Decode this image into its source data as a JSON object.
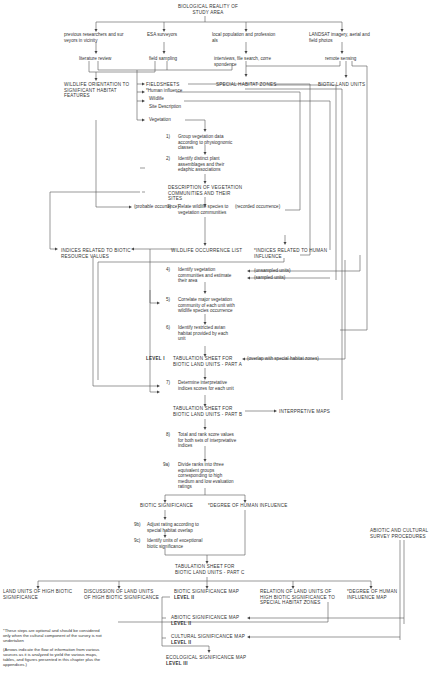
{
  "title": "BIOLOGICAL REALITY OF\nSTUDY AREA",
  "sources": [
    {
      "label": "previous researchers and sur\nveyors in vicinity",
      "method": "literature review"
    },
    {
      "label": "ESA surveyors",
      "method": "field sampling"
    },
    {
      "label": "local population and profession\nals",
      "method": "interviews, file search, corre\nspondence"
    },
    {
      "label": "LANDSAT imagery, aerial and\nfield photos",
      "method": "remote sensing"
    }
  ],
  "wildlife_orientation": "WILDLIFE ORIENTATION TO\nSIGNIFICANT HABITAT\nFEATURES",
  "fieldsheets": {
    "title": "FIELDSHEETS",
    "items": [
      "*Human influence",
      "Wildlife",
      "Site Description",
      "Vegetation"
    ]
  },
  "special_habitat_zones": "SPECIAL HABITAT ZONES",
  "biotic_land_units": "BIOTIC LAND UNITS",
  "steps": {
    "s1": {
      "num": "1)",
      "text": "Group vegetation data\naccording to physiognomic\nclasses"
    },
    "s2": {
      "num": "2)",
      "text": "Identify distinct plant\nassemblages and their\nedaphic associations"
    },
    "s3": {
      "num": "3)",
      "text": "Relate wildlife species to\nvegetation communities"
    },
    "s4": {
      "num": "4)",
      "text": "Identify vegetation\ncommunities and estimate\ntheir area"
    },
    "s5": {
      "num": "5)",
      "text": "Correlate major vegetation\ncommunity of each unit with\nwildlife species occurrence"
    },
    "s6": {
      "num": "6)",
      "text": "Identify restricted avian\nhabitat provided by each\nunit"
    },
    "s7": {
      "num": "7)",
      "text": "Determine interpretative\nindices scores for each unit"
    },
    "s8": {
      "num": "8)",
      "text": "Total and rank score values\nfor both sets of interpretative\nindices"
    },
    "s9a": {
      "num": "9a)",
      "text": "Divide ranks into three\nequivalent groups\ncorresponding to high\nmedium and low evaluation\nratings"
    },
    "s9b": {
      "num": "9b)",
      "text": "Adjust rating according to\nspecial habitat overlap"
    },
    "s9c": {
      "num": "9c)",
      "text": "Identify units of exceptional\nbiotic significance"
    }
  },
  "desc_veg": "DESCRIPTION OF VEGETATION\nCOMMUNITIES AND THEIR\nSITES",
  "probable_occurrence": "(probable occurrence)",
  "recorded_occurrence": "(recorded occurrence)",
  "indices_biotic": "INDICES RELATED TO BIOTIC\nRESOURCE VALUES",
  "wildlife_list": "WILDLIFE OCCURRENCE LIST",
  "indices_human": "*INDICES RELATED TO HUMAN\nINFLUENCE",
  "unsampled": "(unsampled units)",
  "sampled": "(sampled units)",
  "level1": "LEVEL I",
  "tab_a": "TABULATION SHEET FOR\nBIOTIC LAND UNITS - PART A",
  "overlap": "(overlap with special habitat zones)",
  "tab_b": "TABULATION SHEET FOR\nBIOTIC LAND UNITS - PART B",
  "interpretive_maps": "INTERPRETIVE MAPS",
  "biotic_significance": "BIOTIC SIGNIFICANCE",
  "degree_human": "*DEGREE OF HUMAN INFLUENCE",
  "abiotic_cultural": "ABIOTIC AND CULTURAL\nSURVEY PROCEDURES",
  "tab_c": "TABULATION SHEET FOR\nBIOTIC LAND UNITS - PART C",
  "outputs": [
    "LAND UNITS OF HIGH BIOTIC\nSIGNIFICANCE",
    "DISCUSSION OF LAND UNITS\nOF HIGH BIOTIC SIGNIFICANCE",
    "BIOTIC SIGNIFICANCE MAP",
    "RELATION OF LAND UNITS OF\nHIGH BIOTIC SIGNIFICANCE TO\nSPECIAL HABITAT ZONES",
    "*DEGREE OF HUMAN\nINFLUENCE MAP"
  ],
  "biotic_map_level": "LEVEL II",
  "abiotic_map": {
    "title": "ABIOTIC SIGNIFICANCE MAP",
    "level": "LEVEL II"
  },
  "cultural_map": {
    "title": "CULTURAL SIGNIFICANCE MAP",
    "level": "LEVEL II"
  },
  "ecological_map": {
    "title": "ECOLOGICAL SIGNIFICANCE MAP",
    "level": "LEVEL III"
  },
  "footnotes": {
    "optional": "*These steps are optional and should be considered\nonly when the cultural component of the survey is not\nundertaken",
    "arrows": "(Arrows indicate the flow of information from various\nsources as it is analyzed to yield the various maps,\ntables, and figures presented in this chapter plus the\nappendices.)"
  }
}
